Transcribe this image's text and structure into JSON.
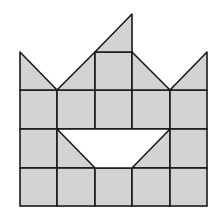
{
  "diagram": {
    "title": "",
    "colors": {
      "fill": "#d3d3d3",
      "stroke": "#1a1a1a",
      "background": "#ffffff",
      "hole": "#ffffff"
    },
    "grid": {
      "columns_x": [
        20,
        57,
        95,
        132,
        170,
        207
      ],
      "rows_y": [
        90,
        129,
        168,
        206
      ],
      "cell_count_cols": 5,
      "cell_count_rows": 3
    },
    "top_shapes": [
      {
        "name": "left-triangle",
        "points": "20,52 20,90 57,90"
      },
      {
        "name": "left-center-triangle",
        "points": "57,90 95,52 95,90"
      },
      {
        "name": "center-square",
        "points": "95,52 132,52 132,90 95,90"
      },
      {
        "name": "top-triangle",
        "points": "95,52 132,14 132,52"
      },
      {
        "name": "right-center-triangle",
        "points": "132,52 170,90 132,90"
      },
      {
        "name": "right-triangle",
        "points": "170,90 207,52 207,90"
      }
    ],
    "hole": {
      "name": "trapezoid-hole",
      "points": "57,129 170,129 132,168 95,168"
    }
  }
}
